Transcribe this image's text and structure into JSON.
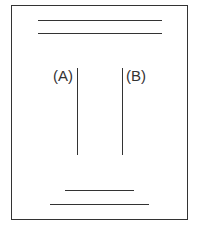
{
  "diagram": {
    "type": "line-diagram",
    "stroke_color": "#333333",
    "background_color": "#ffffff",
    "frame": {
      "x": 11,
      "y": 5,
      "width": 177,
      "height": 215
    },
    "top_lines": [
      {
        "x1": 38,
        "x2": 162,
        "y": 21
      },
      {
        "x1": 38,
        "x2": 162,
        "y": 34
      }
    ],
    "vertical_lines": [
      {
        "id": "A",
        "label": "(A)",
        "x": 78,
        "y1": 68,
        "y2": 155
      },
      {
        "id": "B",
        "label": "(B)",
        "x": 123,
        "y1": 68,
        "y2": 155
      }
    ],
    "bottom_lines": [
      {
        "x1": 65,
        "x2": 134,
        "y": 191
      },
      {
        "x1": 50,
        "x2": 149,
        "y": 205
      }
    ]
  }
}
